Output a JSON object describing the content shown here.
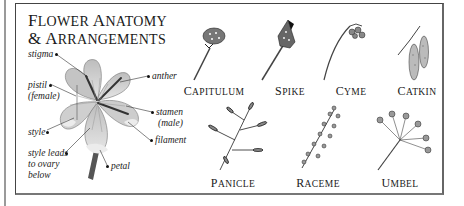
{
  "title": {
    "line1_first": "F",
    "line1_rest": "LOWER",
    "line1b_first": "A",
    "line1b_rest": "NATOMY",
    "line2_amp": "& ",
    "line2_first": "A",
    "line2_rest": "RRANGEMENTS"
  },
  "anatomy_labels": {
    "stigma": "stigma",
    "pistil": "pistil",
    "female": "(female)",
    "style": "style",
    "style_leads_1": "style leads",
    "style_leads_2": "to ovary",
    "style_leads_3": "below",
    "anther": "anther",
    "stamen": "stamen",
    "male": "(male)",
    "filament": "filament",
    "petal": "petal"
  },
  "arrangements": [
    {
      "first": "C",
      "rest": "APITULUM",
      "icon": "capitulum-icon"
    },
    {
      "first": "S",
      "rest": "PIKE",
      "icon": "spike-icon"
    },
    {
      "first": "C",
      "rest": "YME",
      "icon": "cyme-icon"
    },
    {
      "first": "C",
      "rest": "ATKIN",
      "icon": "catkin-icon"
    },
    {
      "first": "P",
      "rest": "ANICLE",
      "icon": "panicle-icon"
    },
    {
      "first": "R",
      "rest": "ACEME",
      "icon": "raceme-icon"
    },
    {
      "first": "U",
      "rest": "MBEL",
      "icon": "umbel-icon"
    }
  ],
  "colors": {
    "ink": "#1a1a1a",
    "frame": "#444444",
    "petal_fill": "#c9c9c9",
    "background": "#ffffff"
  }
}
